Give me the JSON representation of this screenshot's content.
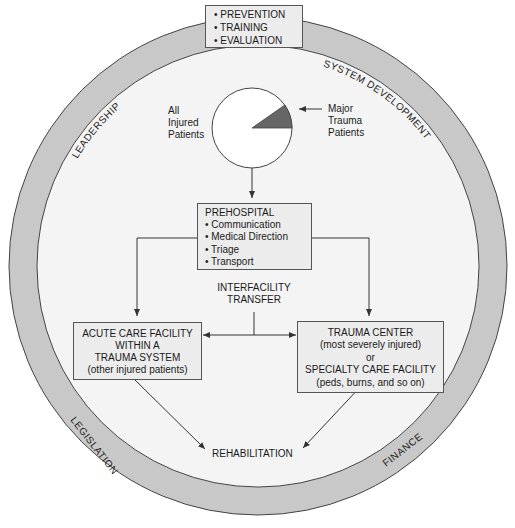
{
  "ring_labels": {
    "top_left": "LEADERSHIP",
    "top_right": "SYSTEM DEVELOPMENT",
    "bottom_left": "LEGISLATION",
    "bottom_right": "FINANCE"
  },
  "top_box": {
    "items": [
      "• PREVENTION",
      "• TRAINING",
      "• EVALUATION"
    ]
  },
  "pie": {
    "left_label": [
      "All",
      "Injured",
      "Patients"
    ],
    "right_label": [
      "Major",
      "Trauma",
      "Patients"
    ],
    "colors": {
      "fill": "#ffffff",
      "wedge": "#666666"
    }
  },
  "prehospital_box": {
    "title": "PREHOSPITAL",
    "items": [
      "• Communication",
      "• Medical Direction",
      "• Triage",
      "• Transport"
    ]
  },
  "interfacility": {
    "lines": [
      "INTERFACILITY",
      "TRANSFER"
    ]
  },
  "acute_box": {
    "lines": [
      "ACUTE CARE FACILITY",
      "WITHIN A",
      "TRAUMA SYSTEM",
      "(other injured patients)"
    ]
  },
  "trauma_box": {
    "lines": [
      "TRAUMA CENTER",
      "(most severely injured)",
      "or",
      "SPECIALTY CARE FACILITY",
      "(peds, burns, and so on)"
    ]
  },
  "rehabilitation": {
    "label": "REHABILITATION"
  },
  "colors": {
    "ring": "#c8c8c8",
    "inner": "#f4f4f4",
    "box_fill": "#ececec",
    "stroke": "#444444"
  }
}
